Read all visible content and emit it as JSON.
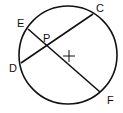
{
  "diagram": {
    "type": "geometry",
    "stroke_color": "#111111",
    "background": "#ffffff",
    "circle": {
      "cx": 68,
      "cy": 55,
      "r": 49
    },
    "center_mark": {
      "x": 69,
      "y": 56,
      "size": 6
    },
    "points": {
      "E": {
        "label": "E",
        "x": 28,
        "y": 29,
        "label_x": 17,
        "label_y": 27
      },
      "C": {
        "label": "C",
        "x": 93,
        "y": 14,
        "label_x": 96,
        "label_y": 12
      },
      "D": {
        "label": "D",
        "x": 21,
        "y": 63,
        "label_x": 9,
        "label_y": 72
      },
      "F": {
        "label": "F",
        "x": 100,
        "y": 92,
        "label_x": 107,
        "label_y": 104
      },
      "P": {
        "label": "P",
        "x": 48,
        "y": 46,
        "label_x": 43,
        "label_y": 42
      }
    },
    "chords": [
      {
        "name": "chord-EF",
        "from": "E",
        "to": "F"
      },
      {
        "name": "chord-DC",
        "from": "D",
        "to": "C"
      }
    ]
  }
}
